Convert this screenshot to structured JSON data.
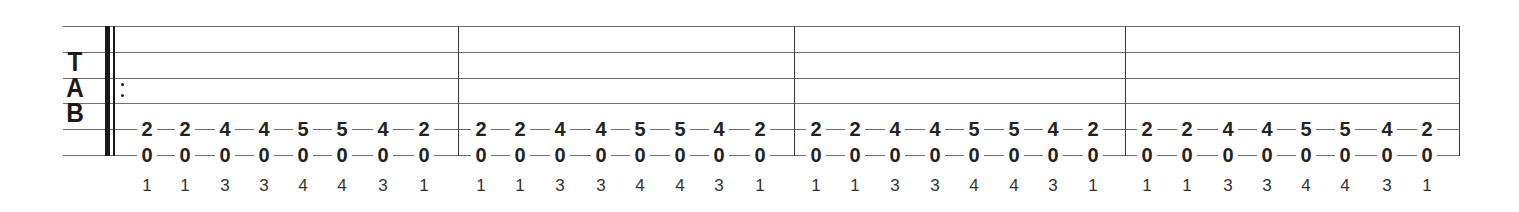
{
  "clef": {
    "letters": [
      "T",
      "A",
      "B"
    ]
  },
  "staff": {
    "line_color": "#6f6f6f",
    "string_count": 6,
    "line_y": [
      26,
      52,
      78,
      103,
      129,
      155
    ],
    "left_x": 63,
    "right_x": 1459,
    "start_repeat": true,
    "barlines_x": [
      458,
      794,
      1125,
      1459
    ]
  },
  "measures": [
    {
      "notes_x": [
        147,
        185,
        225,
        264,
        303,
        342,
        383,
        424
      ],
      "string5_frets": [
        "2",
        "2",
        "4",
        "4",
        "5",
        "5",
        "4",
        "2"
      ],
      "string6_frets": [
        "0",
        "0",
        "0",
        "0",
        "0",
        "0",
        "0",
        "0"
      ],
      "fingering": [
        "1",
        "1",
        "3",
        "3",
        "4",
        "4",
        "3",
        "1"
      ]
    },
    {
      "notes_x": [
        481,
        520,
        560,
        601,
        640,
        680,
        719,
        760
      ],
      "string5_frets": [
        "2",
        "2",
        "4",
        "4",
        "5",
        "5",
        "4",
        "2"
      ],
      "string6_frets": [
        "0",
        "0",
        "0",
        "0",
        "0",
        "0",
        "0",
        "0"
      ],
      "fingering": [
        "1",
        "1",
        "3",
        "3",
        "4",
        "4",
        "3",
        "1"
      ]
    },
    {
      "notes_x": [
        816,
        855,
        895,
        935,
        974,
        1014,
        1053,
        1093
      ],
      "string5_frets": [
        "2",
        "2",
        "4",
        "4",
        "5",
        "5",
        "4",
        "2"
      ],
      "string6_frets": [
        "0",
        "0",
        "0",
        "0",
        "0",
        "0",
        "0",
        "0"
      ],
      "fingering": [
        "1",
        "1",
        "3",
        "3",
        "4",
        "4",
        "3",
        "1"
      ]
    },
    {
      "notes_x": [
        1147,
        1187,
        1228,
        1267,
        1306,
        1345,
        1387,
        1427
      ],
      "string5_frets": [
        "2",
        "2",
        "4",
        "4",
        "5",
        "5",
        "4",
        "2"
      ],
      "string6_frets": [
        "0",
        "0",
        "0",
        "0",
        "0",
        "0",
        "0",
        "0"
      ],
      "fingering": [
        "1",
        "1",
        "3",
        "3",
        "4",
        "4",
        "3",
        "1"
      ]
    }
  ]
}
